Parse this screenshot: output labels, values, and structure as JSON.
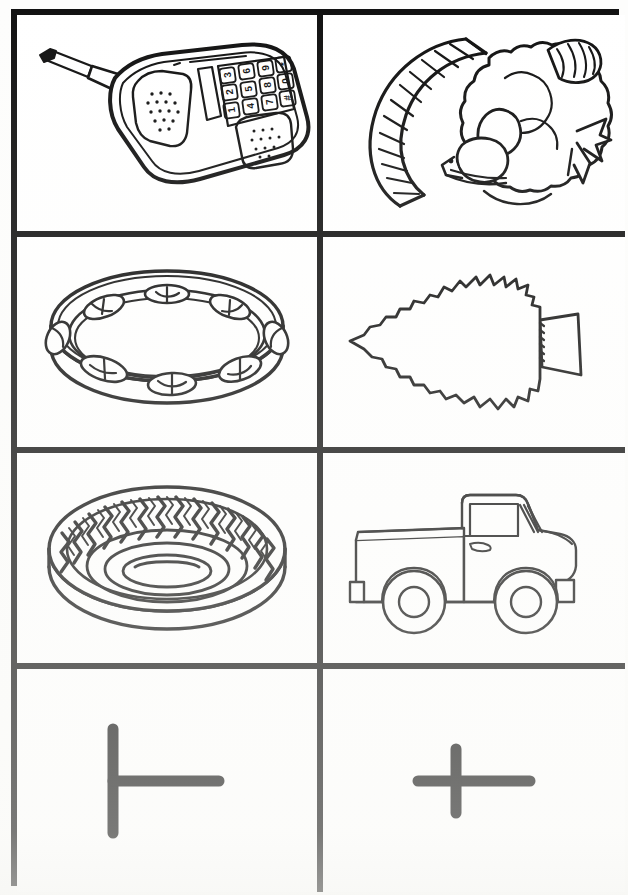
{
  "worksheet": {
    "title": "Letter T Picture Cards",
    "background_color": "#fdfdfc",
    "ink_color": "#111111",
    "border_color": "#111111",
    "columns": 2,
    "rows": 4
  },
  "cells": [
    {
      "id": "cell-telephone",
      "row": 1,
      "column": 1,
      "label": "telephone",
      "icon_name": "telephone-line-art",
      "description": "Black-and-white line drawing of a cordless handset telephone tilted diagonally, with an extended antenna at upper left, an earpiece speaker grille of dots, a twelve-key number pad, and a mouthpiece grille of dots at lower right.",
      "keypad": [
        "1",
        "2",
        "3",
        "4",
        "5",
        "6",
        "7",
        "8",
        "9",
        "*",
        "0",
        "#"
      ]
    },
    {
      "id": "cell-turkey",
      "row": 1,
      "column": 2,
      "label": "turkey",
      "icon_name": "turkey-line-art",
      "description": "Black-and-white line drawing of a turkey rotated on its side; striped fan tail curves along the left, scalloped feather body in the middle, wing feathers at upper right, head and beak with a small eye at lower left, and splayed feet at right."
    },
    {
      "id": "cell-tambourine",
      "row": 2,
      "column": 1,
      "label": "tambourine",
      "icon_name": "tambourine-line-art",
      "description": "Black-and-white line drawing of a tambourine seen at an angle: an open hoop shell with eight slotted openings holding pairs of jingles around the rim."
    },
    {
      "id": "cell-tree",
      "row": 2,
      "column": 2,
      "label": "tree",
      "icon_name": "tree-line-art",
      "description": "Black-and-white outline of an evergreen pine tree rotated ninety degrees so the point faces left and the rectangular trunk sticks out to the right; the silhouette has jagged bough edges."
    },
    {
      "id": "cell-tire",
      "row": 3,
      "column": 1,
      "label": "tire",
      "icon_name": "tire-line-art",
      "description": "Black-and-white line drawing of a rubber tire viewed from above at an angle, showing a bold zig-zag tread pattern around the outer wall and concentric oval rings forming the inner hub hole."
    },
    {
      "id": "cell-truck",
      "row": 3,
      "column": 2,
      "label": "truck",
      "icon_name": "truck-line-art",
      "description": "Black-and-white outline of a pickup truck in side profile facing right, with an open cargo bed at the rear, a cab with a side window and door handle, front hood, two bumpers and two round wheels."
    },
    {
      "id": "cell-letter-T-uppercase",
      "row": 4,
      "column": 1,
      "label": "T",
      "icon_name": "letter-t-uppercase-rotated-glyph",
      "description": "Thick black uppercase letter T rotated ninety degrees clockwise: a tall vertical bar on the left with a horizontal bar extending to the right from its middle."
    },
    {
      "id": "cell-letter-t-lowercase",
      "row": 4,
      "column": 2,
      "label": "t",
      "icon_name": "letter-t-lowercase-rotated-glyph",
      "description": "Thick black lowercase letter t rotated ninety degrees, appearing as a plus or cross: a long horizontal bar crossed by a shorter vertical bar near its centre."
    }
  ]
}
